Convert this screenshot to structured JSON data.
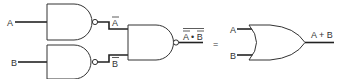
{
  "diagram": {
    "left_circuit": {
      "inputs": [
        {
          "label": "A"
        },
        {
          "label": "B"
        }
      ],
      "inverter_outputs": [
        {
          "label": "A",
          "overline": true
        },
        {
          "label": "B",
          "overline": true
        }
      ],
      "gates": [
        {
          "type": "NAND",
          "role": "inverter-A"
        },
        {
          "type": "NAND",
          "role": "inverter-B"
        },
        {
          "type": "NAND",
          "role": "combine"
        }
      ],
      "output": {
        "label": "A • B",
        "overline_parts": [
          "A",
          "B"
        ],
        "whole_overline": true
      }
    },
    "equals_sign": "=",
    "right_circuit": {
      "inputs": [
        {
          "label": "A"
        },
        {
          "label": "B"
        }
      ],
      "gate": {
        "type": "OR"
      },
      "output": {
        "label": "A + B"
      }
    },
    "colors": {
      "line": "#222222",
      "text": "#333333",
      "background": "#ffffff"
    }
  }
}
